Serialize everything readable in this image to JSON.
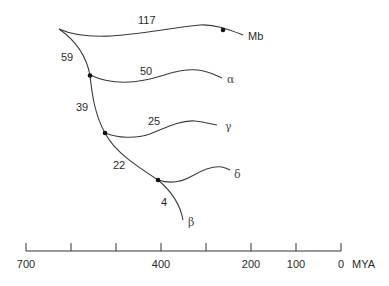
{
  "diagram": {
    "type": "phylogenetic-tree",
    "colors": {
      "line": "#3a3a3a",
      "node": "#111111",
      "text": "#2a2a2a"
    },
    "branch_labels": {
      "root_to_alpha": "59",
      "root_to_mb": "117",
      "alpha": "50",
      "alpha_to_gamma": "39",
      "gamma": "25",
      "gamma_to_delta": "22",
      "beta": "4"
    },
    "taxa": {
      "mb": "Mb",
      "alpha": "α",
      "gamma": "γ",
      "delta": "δ",
      "beta": "β"
    },
    "axis": {
      "unit": "MYA",
      "ticks": [
        "700",
        "600",
        "500",
        "400",
        "300",
        "200",
        "100",
        "0"
      ],
      "labels": {
        "t700": "700",
        "t400": "400",
        "t200": "200",
        "t100": "100",
        "t0": "0"
      },
      "unit_label": "MYA"
    }
  }
}
